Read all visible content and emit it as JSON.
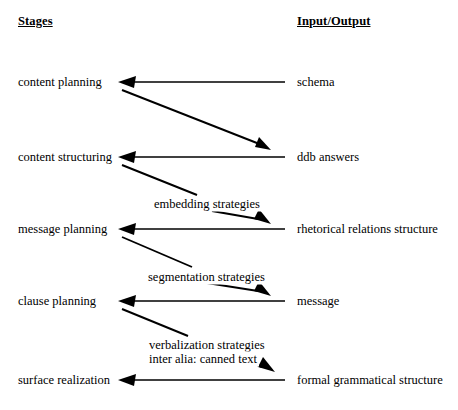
{
  "diagram": {
    "title_left": "Stages",
    "title_right": "Input/Output",
    "rows": [
      {
        "stage": "content planning",
        "io": "schema",
        "y": 82
      },
      {
        "stage": "content structuring",
        "io": "ddb answers",
        "y": 157
      },
      {
        "stage": "message planning",
        "io": "rhetorical relations structure",
        "y": 229
      },
      {
        "stage": "clause planning",
        "io": "message",
        "y": 301
      },
      {
        "stage": "surface realization",
        "io": "formal grammatical structure",
        "y": 380
      }
    ],
    "transitions": [
      {
        "label": "",
        "label_line2": ""
      },
      {
        "label": "embedding strategies",
        "label_line2": ""
      },
      {
        "label": "segmentation strategies",
        "label_line2": ""
      },
      {
        "label": "verbalization strategies",
        "label_line2": "inter alia: canned text"
      }
    ],
    "labels": {
      "embedding": "embedding strategies",
      "segmentation": "segmentation strategies",
      "verbalization": "verbalization strategies",
      "inter_alia": "inter alia: canned text"
    },
    "colors": {
      "ink": "#000000",
      "background": "#ffffff"
    }
  }
}
